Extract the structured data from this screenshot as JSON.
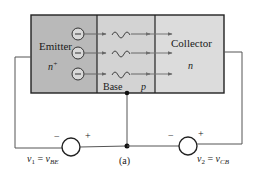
{
  "figure": {
    "caption": "(a)",
    "colors": {
      "emitter_fill": "#b9b9b9",
      "base_fill": "#d3d3d3",
      "collector_fill": "#dcdcdc",
      "stroke": "#222222",
      "wire": "#555555",
      "arrow": "#666666"
    }
  },
  "regions": {
    "emitter": {
      "label": "Emitter",
      "doping": "n",
      "doping_sup": "+"
    },
    "base": {
      "label": "Base",
      "doping": "p"
    },
    "collector": {
      "label": "Collector",
      "doping": "n"
    }
  },
  "carriers": {
    "count": 3,
    "symbol": "−",
    "description": "electrons injected from emitter, diffusing through base, swept into collector"
  },
  "sources": [
    {
      "name": "v1",
      "label_left": "v",
      "label_sub1": "1",
      "eq": " = ",
      "label_right": "v",
      "label_sub2": "BE",
      "minus": "−",
      "plus": "+"
    },
    {
      "name": "v2",
      "label_left": "v",
      "label_sub1": "2",
      "eq": " = ",
      "label_right": "v",
      "label_sub2": "CB",
      "minus": "−",
      "plus": "+"
    }
  ]
}
